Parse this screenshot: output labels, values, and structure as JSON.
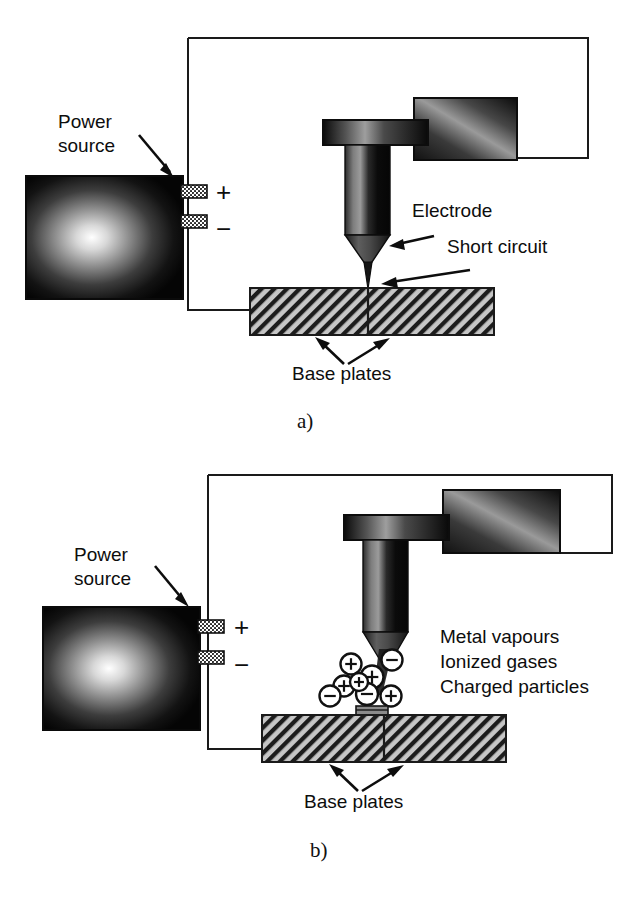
{
  "figure": {
    "background_color": "#ffffff",
    "ink_color": "#111111"
  },
  "panels": [
    {
      "id": "a",
      "caption": "a)",
      "labels": {
        "power_source": "Power\nsource",
        "power_source_line1": "Power",
        "power_source_line2": "source",
        "plus": "+",
        "minus": "−",
        "electrode": "Electrode",
        "short_circuit": "Short circuit",
        "base_plates": "Base plates"
      }
    },
    {
      "id": "b",
      "caption": "b)",
      "labels": {
        "power_source_line1": "Power",
        "power_source_line2": "source",
        "plus": "+",
        "minus": "−",
        "base_plates": "Base plates",
        "plasma_line1": "Metal vapours",
        "plasma_line2": "Ionized gases",
        "plasma_line3": "Charged particles"
      },
      "particles": [
        {
          "cx": 351,
          "cy": 211,
          "r": 10.5,
          "charge": "+"
        },
        {
          "cx": 392,
          "cy": 207,
          "r": 10.5,
          "charge": "−"
        },
        {
          "cx": 372,
          "cy": 224,
          "r": 11.5,
          "charge": "+"
        },
        {
          "cx": 344,
          "cy": 233,
          "r": 10.5,
          "charge": "+"
        },
        {
          "cx": 330,
          "cy": 243,
          "r": 10.5,
          "charge": "−"
        },
        {
          "cx": 367,
          "cy": 241,
          "r": 11.0,
          "charge": "−"
        },
        {
          "cx": 391,
          "cy": 243,
          "r": 10.5,
          "charge": "+"
        },
        {
          "cx": 359,
          "cy": 229,
          "r": 9.0,
          "charge": "+"
        }
      ]
    }
  ],
  "colors": {
    "stroke": "#111111",
    "hatch_fill": "#b8b8b8",
    "weld_pool": "#8a8a8a",
    "box_dark": "#0a0a0a",
    "box_light": "#f2f2f2",
    "electrode_dark": "#0d0d0d",
    "electrode_mid": "#6b6b6b"
  }
}
